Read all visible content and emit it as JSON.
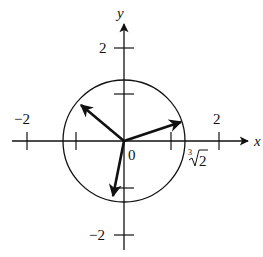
{
  "diagram": {
    "type": "complex-plane-roots",
    "axes": {
      "x_label": "x",
      "y_label": "y",
      "origin_label": "0",
      "x_ticks": [
        {
          "value": -2,
          "label": "−2"
        },
        {
          "value": -1,
          "label": ""
        },
        {
          "value": 1,
          "label": ""
        },
        {
          "value": 2,
          "label": "2"
        }
      ],
      "y_ticks": [
        {
          "value": 2,
          "label": "2"
        },
        {
          "value": 1,
          "label": ""
        },
        {
          "value": -1,
          "label": ""
        },
        {
          "value": -2,
          "label": "−2"
        }
      ]
    },
    "circle": {
      "radius_label_index": "3",
      "radius_label_radicand": "2",
      "radius_value": "∛2"
    },
    "vectors": [
      {
        "name": "root-1",
        "angle_deg": 20
      },
      {
        "name": "root-2",
        "angle_deg": 140
      },
      {
        "name": "root-3",
        "angle_deg": 260
      }
    ],
    "colors": {
      "ink": "#111111",
      "background": "#ffffff"
    }
  }
}
